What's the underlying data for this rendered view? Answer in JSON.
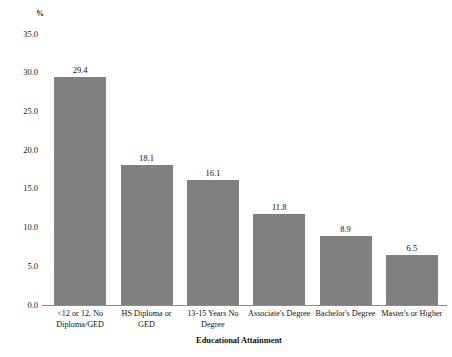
{
  "chart_data": {
    "type": "bar",
    "title": "",
    "subtitle": "",
    "xlabel": "Educational Attainment",
    "ylabel": "%",
    "categories": [
      "<12 or 12, No Diploma/GED",
      "HS Diploma or GED",
      "13-15 Years No Degree",
      "Associate's Degree",
      "Bachelor's Degree",
      "Master's or Higher"
    ],
    "category_lines": [
      [
        "<12 or 12, No",
        "Diploma/GED"
      ],
      [
        "HS Diploma or GED"
      ],
      [
        "13-15 Years No",
        "Degree"
      ],
      [
        "Associate's Degree"
      ],
      [
        "Bachelor's Degree"
      ],
      [
        "Master's or Higher"
      ]
    ],
    "values": [
      29.4,
      18.1,
      16.1,
      11.8,
      8.9,
      6.5
    ],
    "value_labels": [
      "29.4",
      "18.1",
      "16.1",
      "11.8",
      "8.9",
      "6.5"
    ],
    "ylim": [
      0.0,
      35.0
    ],
    "y_ticks": [
      35.0,
      30.0,
      25.0,
      20.0,
      15.0,
      10.0,
      5.0,
      0.0
    ],
    "y_tick_labels": [
      "35.0",
      "30.0",
      "25.0",
      "20.0",
      "15.0",
      "10.0",
      "5.0",
      "0.0"
    ],
    "grid": false,
    "legend": false,
    "legend_position": "none",
    "bar_color": "#808080",
    "axis_color": "#8c8c8c",
    "text_color": "#111111",
    "background_color": "#ffffff"
  }
}
